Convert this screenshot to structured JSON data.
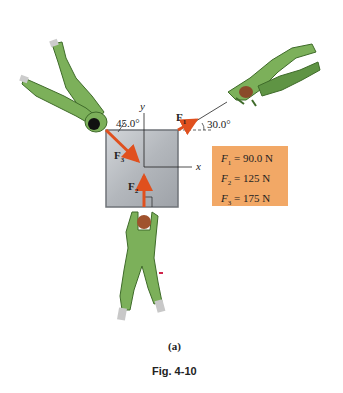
{
  "figure": {
    "caption": "Fig. 4-10",
    "subfigure_label": "(a)"
  },
  "axes": {
    "x_label": "x",
    "y_label": "y"
  },
  "forces": [
    {
      "name": "F",
      "sub": "1",
      "angle_label": "30.0°",
      "magnitude": "90.0 N"
    },
    {
      "name": "F",
      "sub": "2",
      "angle_label": "",
      "magnitude": "125 N"
    },
    {
      "name": "F",
      "sub": "3",
      "angle_label": "45.0°",
      "magnitude": "175 N"
    }
  ],
  "legend": {
    "rows": [
      {
        "symbol": "F",
        "sub": "1",
        "eq": " = 90.0 N"
      },
      {
        "symbol": "F",
        "sub": "2",
        "eq": " = 125 N"
      },
      {
        "symbol": "F",
        "sub": "3",
        "eq": " = 175 N"
      }
    ]
  },
  "colors": {
    "arrow": "#e0501e",
    "box_fill": "#b9bcc1",
    "legend_bg": "#f2a866",
    "suit_green": "#7cb05a",
    "suit_dark": "#3f6b2a"
  }
}
